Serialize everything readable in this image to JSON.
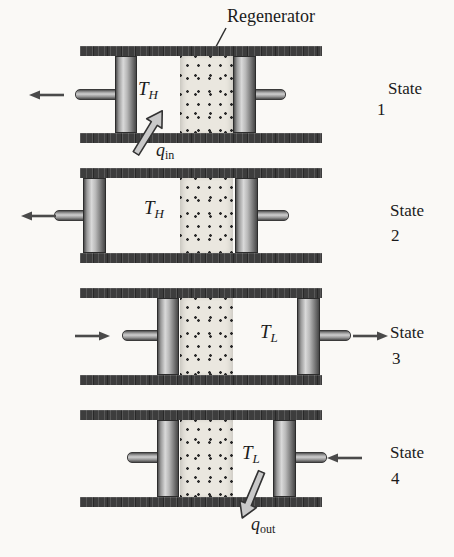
{
  "regenerator_label": "Regenerator",
  "states": [
    {
      "word": "State",
      "number": "1",
      "temp": {
        "base": "T",
        "sub": "H"
      },
      "heat": {
        "base": "q",
        "sub": "in"
      }
    },
    {
      "word": "State",
      "number": "2",
      "temp": {
        "base": "T",
        "sub": "H"
      }
    },
    {
      "word": "State",
      "number": "3",
      "temp": {
        "base": "T",
        "sub": "L"
      }
    },
    {
      "word": "State",
      "number": "4",
      "temp": {
        "base": "T",
        "sub": "L"
      },
      "heat": {
        "base": "q",
        "sub": "out"
      }
    }
  ],
  "colors": {
    "background": "#faf9f6",
    "text": "#1b1b1b",
    "wall": "#3d3d3d",
    "piston_dark": "#4f4f4f",
    "piston_light": "#d9d9d9",
    "rod_dark": "#525252",
    "rod_light": "#cfcfcf",
    "regen_bg": "#eae7df",
    "dot": "#2b2b2b",
    "motion_arrow": "#4a4a4a",
    "heat_arrow_fill": "#c9c9c9",
    "heat_arrow_stroke": "#333333",
    "pointer_line": "#2e2e2e"
  }
}
